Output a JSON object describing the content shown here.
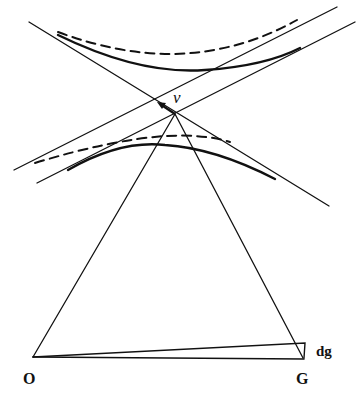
{
  "diagram": {
    "labels": {
      "nu": "ν",
      "dg": "dg",
      "origin": "O",
      "galaxy": "G"
    },
    "colors": {
      "ink": "#111111",
      "background": "#ffffff"
    },
    "elements": [
      "descending-asymptote-line",
      "upper-ascending-line",
      "lower-ascending-line",
      "upper-solid-hyperbola",
      "upper-dashed-hyperbola",
      "lower-solid-hyperbola",
      "lower-dashed-hyperbola",
      "apex-to-O-line",
      "apex-to-G-line",
      "O-G-baseline",
      "dg-wedge",
      "nu-arrow"
    ]
  }
}
